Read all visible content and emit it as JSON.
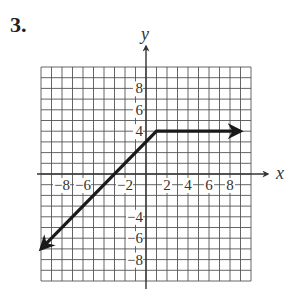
{
  "problem_number": "3.",
  "chart_data": {
    "type": "line",
    "title": "",
    "xlabel": "x",
    "ylabel": "y",
    "xlim": [
      -10,
      10
    ],
    "ylim": [
      -10,
      10
    ],
    "grid": true,
    "grid_step": 1,
    "x_tick_labels": [
      "-8",
      "-6",
      "-2",
      "2",
      "4",
      "6",
      "8"
    ],
    "y_tick_labels": [
      "8",
      "6",
      "4",
      "-4",
      "-6",
      "-8"
    ],
    "series": [
      {
        "name": "piecewise",
        "description": "y = x + 3 for x < 1; y = 4 for x >= 1",
        "points": [
          [
            -10,
            -7
          ],
          [
            1,
            4
          ],
          [
            9,
            4
          ]
        ],
        "arrows": [
          "start",
          "end"
        ]
      }
    ]
  },
  "colors": {
    "grid": "#555555",
    "axis": "#333333",
    "line": "#1a1a1a"
  }
}
